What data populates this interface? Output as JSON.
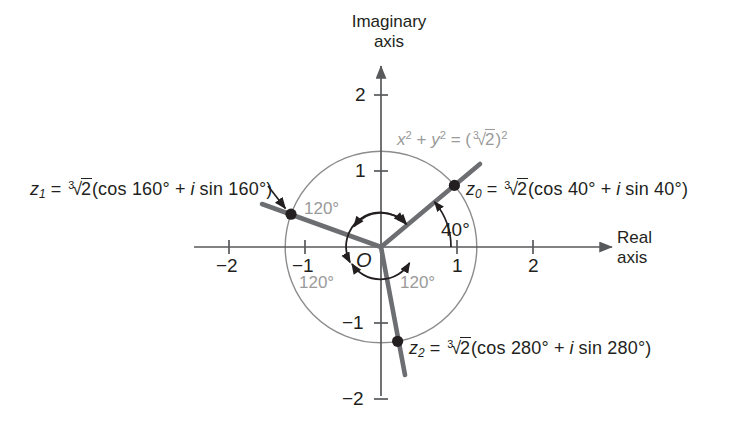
{
  "figure": {
    "type": "complex-plane-diagram",
    "background_color": "#ffffff",
    "ray_color": "#6d6e71",
    "circle_color": "#8c8c8c",
    "axis_color": "#58595b",
    "gray_text_color": "#9a9a9a",
    "text_color": "#231f20"
  },
  "axes": {
    "imaginary_label_line1": "Imaginary",
    "imaginary_label_line2": "axis",
    "real_label_line1": "Real",
    "real_label_line2": "axis",
    "origin_label": "O",
    "x_ticks": [
      "−2",
      "−1",
      "1",
      "2"
    ],
    "x_tick_values": [
      -2,
      -1,
      1,
      2
    ],
    "y_ticks": [
      "2",
      "1",
      "−1",
      "−2"
    ],
    "y_tick_values": [
      2,
      1,
      -1,
      -2
    ]
  },
  "circle": {
    "equation_lhs_x": "x",
    "equation_lhs_y": "y",
    "equation_text": "x² + y² = (∛2)²",
    "radicand": "2",
    "index": "3",
    "radius_value": 1.2599
  },
  "roots": [
    {
      "name": "z0",
      "symbol": "z",
      "subscript": "0",
      "equals": "=",
      "index": "3",
      "radicand": "2",
      "expression": "(cos 40° + i sin 40°)",
      "cos_part": "cos 40°",
      "sin_part": "sin 40°",
      "angle_deg": 40,
      "full_text": "z₀ = ∛2(cos 40° + i sin 40°)"
    },
    {
      "name": "z1",
      "symbol": "z",
      "subscript": "1",
      "equals": "=",
      "index": "3",
      "radicand": "2",
      "expression": "(cos 160° + i sin 160°)",
      "cos_part": "cos 160°",
      "sin_part": "sin 160°",
      "angle_deg": 160,
      "full_text": "z₁ = ∛2(cos 160° + i sin 160°)"
    },
    {
      "name": "z2",
      "symbol": "z",
      "subscript": "2",
      "equals": "=",
      "index": "3",
      "radicand": "2",
      "expression": "(cos 280° + i sin 280°)",
      "cos_part": "cos 280°",
      "sin_part": "sin 280°",
      "angle_deg": 280,
      "full_text": "z₂ = ∛2(cos 280° + i sin 280°)"
    }
  ],
  "angle_annotations": [
    {
      "name": "angle-40",
      "label": "40°",
      "value_deg": 40,
      "style": "dark"
    },
    {
      "name": "angle-120-upper-left",
      "label": "120°",
      "value_deg": 120,
      "style": "gray"
    },
    {
      "name": "angle-120-lower-left",
      "label": "120°",
      "value_deg": 120,
      "style": "gray"
    },
    {
      "name": "angle-120-lower-right",
      "label": "120°",
      "value_deg": 120,
      "style": "gray"
    }
  ],
  "math_symbols": {
    "plus": "+",
    "i": "i",
    "open_paren": "(",
    "close_paren": ")",
    "degree": "°",
    "radical": "√"
  }
}
